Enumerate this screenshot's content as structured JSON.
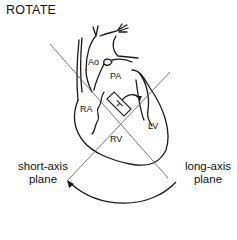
{
  "diagram": {
    "title": "ROTATE",
    "structures": {
      "ao": "Ao",
      "pa": "PA",
      "ra": "RA",
      "rv": "RV",
      "lv": "LV"
    },
    "planes": {
      "short_axis_line1": "short-axis",
      "short_axis_line2": "plane",
      "long_axis_line1": "long-axis",
      "long_axis_line2": "plane"
    },
    "colors": {
      "stroke": "#1a1a1a",
      "plane_line": "#555555",
      "background": "#ffffff"
    }
  }
}
